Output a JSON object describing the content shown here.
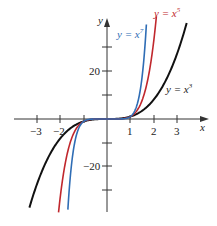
{
  "chart_data": {
    "type": "line",
    "title": "",
    "xlabel": "x",
    "ylabel": "y",
    "xlim": [
      -3.6,
      4.3
    ],
    "ylim": [
      -39,
      41
    ],
    "grid": false,
    "legend_position": "inline labels",
    "x_ticks": [
      -3,
      -2,
      -1,
      1,
      2,
      3
    ],
    "x_tick_labels": [
      "−3",
      "−2",
      "",
      "1",
      "2",
      "3"
    ],
    "y_ticks": [
      -30,
      -20,
      -10,
      10,
      20,
      30
    ],
    "y_tick_labels": [
      "",
      "−20",
      "",
      "",
      "20",
      ""
    ],
    "series": [
      {
        "name": "y = x^3",
        "label": "y = x",
        "exponent": 3,
        "color": "#111111",
        "x_range": [
          -3.33,
          3.42
        ]
      },
      {
        "name": "y = x^5",
        "label": "y = x",
        "exponent": 5,
        "color": "#c0272d",
        "x_range": [
          -2.08,
          2.12
        ]
      },
      {
        "name": "y = x^7",
        "label": "y = x",
        "exponent": 7,
        "color": "#2f6db5",
        "x_range": [
          -1.68,
          1.69
        ]
      }
    ]
  },
  "labels": {
    "x_axis": "x",
    "y_axis": "y",
    "x3": {
      "base": "y = x",
      "sup": "3"
    },
    "x5": {
      "base": "y = x",
      "sup": "5"
    },
    "x7": {
      "base": "y = x",
      "sup": "7"
    },
    "tick_m3": "−3",
    "tick_m2": "−2",
    "tick_1": "1",
    "tick_2": "2",
    "tick_3": "3",
    "tick_20": "20",
    "tick_m20": "−20"
  }
}
